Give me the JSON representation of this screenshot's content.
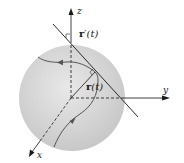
{
  "diagram": {
    "axes": {
      "x": {
        "label": "x"
      },
      "y": {
        "label": "y"
      },
      "z": {
        "label": "z"
      }
    },
    "vectors": {
      "position": {
        "bold": "r",
        "arg": "(t)"
      },
      "tangent": {
        "bold": "r",
        "prime": "′",
        "arg": "(t)"
      }
    },
    "colors": {
      "sphere_fill": "#d4d4d4",
      "sphere_edge": "#e6e6e6",
      "lines": "#2a2a2a",
      "curve": "#555555"
    }
  }
}
